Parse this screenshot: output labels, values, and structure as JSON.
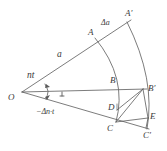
{
  "figure": {
    "kind": "geometric-construction",
    "background_color": "#ffffff",
    "stroke_color": "#5a5a5a",
    "label_color": "#3a3a3a",
    "width": 167,
    "height": 151,
    "labels": {
      "origin": "O",
      "angle_upper": "nt",
      "angle_lower": "−Δn·t",
      "radius": "a",
      "delta_radius": "Δa",
      "point_A": "A",
      "point_A_prime": "A′",
      "point_B": "B",
      "point_B_prime": "B′",
      "point_C": "C",
      "point_C_prime": "C′",
      "point_D": "D",
      "point_E": "E"
    },
    "geometry": {
      "O": [
        22,
        92
      ],
      "A": [
        97,
        36
      ],
      "A_prime": [
        128,
        22
      ],
      "B": [
        120,
        89
      ],
      "B_prime": [
        143,
        89
      ],
      "C": [
        116,
        122
      ],
      "C_prime": [
        146,
        128
      ],
      "D": [
        117,
        109
      ],
      "E": [
        148,
        118
      ]
    }
  }
}
